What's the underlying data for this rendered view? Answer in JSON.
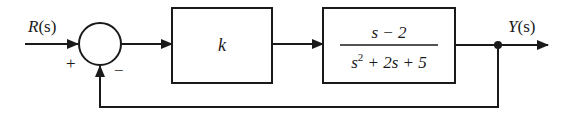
{
  "diagram": {
    "type": "feedback-block-diagram",
    "input": {
      "label": "R(s)",
      "symbol": "R",
      "arg": "(s)"
    },
    "output": {
      "label": "Y(s)",
      "symbol": "Y",
      "arg": "(s)"
    },
    "summing_junction": {
      "plus_sign": "+",
      "minus_sign": "−"
    },
    "blocks": [
      {
        "id": "gain",
        "label": "k"
      },
      {
        "id": "plant",
        "numerator": "s − 2",
        "denominator_s": "s",
        "denominator_exp": "2",
        "denominator_rest": " + 2s + 5"
      }
    ],
    "feedback": {
      "type": "unity",
      "sign": "negative"
    },
    "colors": {
      "stroke": "#1a1a1a",
      "background": "#ffffff"
    }
  }
}
